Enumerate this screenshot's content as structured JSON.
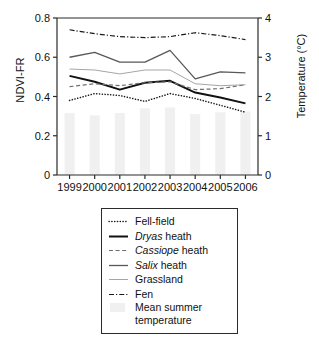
{
  "chart_data": {
    "type": "line",
    "title": "",
    "subtitle": "",
    "xlabel": "",
    "ylabel": "NDVI-FR",
    "ylabel_right": "Temperature (°C)",
    "x": [
      "1999",
      "2000",
      "2001",
      "2002",
      "2003",
      "2004",
      "2005",
      "2006"
    ],
    "categories": [
      "1999",
      "2000",
      "2001",
      "2002",
      "2003",
      "2004",
      "2005",
      "2006"
    ],
    "ylim": [
      0,
      0.8
    ],
    "yticks": [
      "0",
      "0.2",
      "0.4",
      "0.6",
      "0.8"
    ],
    "ytick_values": [
      0,
      0.2,
      0.4,
      0.6,
      0.8
    ],
    "ylim_right": [
      0,
      4
    ],
    "yticks_right": [
      "0",
      "1",
      "2",
      "3",
      "4"
    ],
    "ytick_values_right": [
      0,
      1,
      2,
      3,
      4
    ],
    "grid": false,
    "legend_position": "below-plot",
    "series": [
      {
        "name": "Fell-field",
        "style": "dotted",
        "color": "#1a1a1a",
        "axis": "left",
        "values": [
          0.38,
          0.415,
          0.405,
          0.375,
          0.415,
          0.39,
          0.355,
          0.32
        ]
      },
      {
        "name": "Dryas heath",
        "style": "solid-bold",
        "color": "#111111",
        "axis": "left",
        "values": [
          0.505,
          0.475,
          0.435,
          0.47,
          0.48,
          0.42,
          0.395,
          0.365
        ]
      },
      {
        "name": "Cassiope heath",
        "style": "dashed",
        "color": "#6e6e6e",
        "axis": "left",
        "values": [
          0.45,
          0.465,
          0.455,
          0.47,
          0.475,
          0.435,
          0.44,
          0.46
        ]
      },
      {
        "name": "Salix heath",
        "style": "solid-medium",
        "color": "#585858",
        "axis": "left",
        "values": [
          0.6,
          0.625,
          0.575,
          0.575,
          0.635,
          0.49,
          0.525,
          0.52
        ]
      },
      {
        "name": "Grassland",
        "style": "solid-thin",
        "color": "#a6a6a6",
        "axis": "left",
        "values": [
          0.54,
          0.535,
          0.515,
          0.535,
          0.535,
          0.465,
          0.455,
          0.46
        ]
      },
      {
        "name": "Fen",
        "style": "dash-dot",
        "color": "#1a1a1a",
        "axis": "left",
        "values": [
          0.74,
          0.72,
          0.705,
          0.7,
          0.705,
          0.725,
          0.71,
          0.69
        ]
      }
    ],
    "bars": {
      "name": "Mean summer temperature",
      "axis": "right",
      "color": "#f0f0f0",
      "values": [
        1.58,
        1.52,
        1.58,
        1.7,
        1.72,
        1.55,
        1.6,
        1.62
      ]
    }
  },
  "axes": {
    "left_title": "NDVI-FR",
    "right_title": "Temperature (°C)"
  },
  "legend": {
    "items": [
      {
        "label": "Fell-field",
        "italic_prefix": "",
        "key": "dotted-line-icon"
      },
      {
        "label": " heath",
        "italic_prefix": "Dryas",
        "key": "solid-bold-line-icon"
      },
      {
        "label": " heath",
        "italic_prefix": "Cassiope",
        "key": "dashed-line-icon"
      },
      {
        "label": " heath",
        "italic_prefix": "Salix",
        "key": "solid-medium-line-icon"
      },
      {
        "label": "Grassland",
        "italic_prefix": "",
        "key": "solid-thin-line-icon"
      },
      {
        "label": "Fen",
        "italic_prefix": "",
        "key": "dash-dot-line-icon"
      },
      {
        "label": "Mean summer temperature",
        "italic_prefix": "",
        "key": "bar-swatch-icon"
      }
    ]
  },
  "colors": {
    "axis": "#2b2b2b",
    "bar_fill": "#f0f0f0",
    "text": "#111111"
  }
}
